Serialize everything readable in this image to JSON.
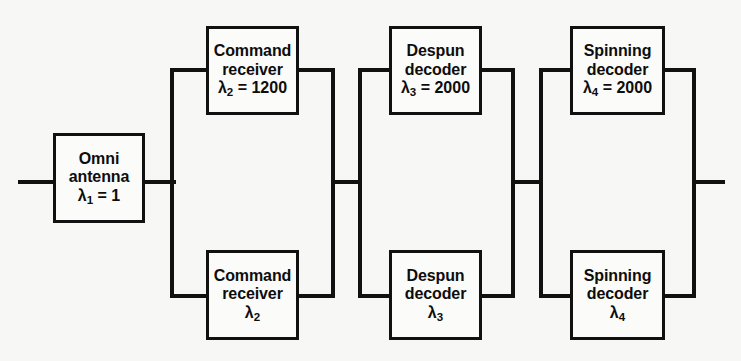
{
  "diagram": {
    "type": "reliability-block-diagram",
    "title": "",
    "line_color": "#111111",
    "box_fill": "#fbfbf9",
    "background": "#f7f7f5",
    "blocks": [
      {
        "id": "omni-antenna",
        "line1": "Omni",
        "line2": "antenna",
        "symbol": "λ",
        "subscript": "1",
        "relation": " = 1",
        "lambda_text": "λ1 = 1",
        "lambda_value": "1",
        "stage": 1,
        "branch": "single"
      },
      {
        "id": "command-receiver-top",
        "line1": "Command",
        "line2": "receiver",
        "symbol": "λ",
        "subscript": "2",
        "relation": " = 1200",
        "lambda_text": "λ2 = 1200",
        "lambda_value": "1200",
        "stage": 2,
        "branch": "top"
      },
      {
        "id": "command-receiver-bottom",
        "line1": "Command",
        "line2": "receiver",
        "symbol": "λ",
        "subscript": "2",
        "relation": "",
        "lambda_text": "λ2",
        "lambda_value": "",
        "stage": 2,
        "branch": "bottom"
      },
      {
        "id": "despun-decoder-top",
        "line1": "Despun",
        "line2": "decoder",
        "symbol": "λ",
        "subscript": "3",
        "relation": " = 2000",
        "lambda_text": "λ3 = 2000",
        "lambda_value": "2000",
        "stage": 3,
        "branch": "top"
      },
      {
        "id": "despun-decoder-bottom",
        "line1": "Despun",
        "line2": "decoder",
        "symbol": "λ",
        "subscript": "3",
        "relation": "",
        "lambda_text": "λ3",
        "lambda_value": "",
        "stage": 3,
        "branch": "bottom"
      },
      {
        "id": "spinning-decoder-top",
        "line1": "Spinning",
        "line2": "decoder",
        "symbol": "λ",
        "subscript": "4",
        "relation": " = 2000",
        "lambda_text": "λ4 = 2000",
        "lambda_value": "2000",
        "stage": 4,
        "branch": "top"
      },
      {
        "id": "spinning-decoder-bottom",
        "line1": "Spinning",
        "line2": "decoder",
        "symbol": "λ",
        "subscript": "4",
        "relation": "",
        "lambda_text": "λ4",
        "lambda_value": "",
        "stage": 4,
        "branch": "bottom"
      }
    ]
  }
}
